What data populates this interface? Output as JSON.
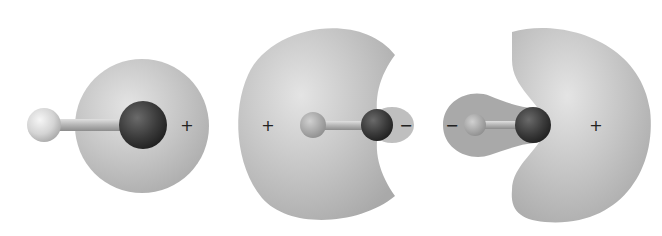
{
  "diagram": {
    "type": "molecular-orbital-lobes",
    "panels": [
      {
        "id": "orbital-1",
        "left_atom": "light-small-atom",
        "right_atom": "dark-large-atom",
        "signs": [
          {
            "label": "+",
            "x": 187,
            "y": 126
          }
        ]
      },
      {
        "id": "orbital-2",
        "left_atom": "light-small-atom",
        "right_atom": "dark-large-atom",
        "signs": [
          {
            "label": "+",
            "x": 268,
            "y": 126
          },
          {
            "label": "−",
            "x": 406,
            "y": 126
          }
        ]
      },
      {
        "id": "orbital-3",
        "left_atom": "light-small-atom",
        "right_atom": "dark-large-atom",
        "signs": [
          {
            "label": "−",
            "x": 452,
            "y": 126
          },
          {
            "label": "+",
            "x": 596,
            "y": 126
          }
        ]
      }
    ],
    "colors": {
      "lobe": "#b9b9b9",
      "lobe_highlight": "#e2e2e2",
      "dark_atom": "#3a3a3a",
      "light_atom": "#d8d8d8",
      "bond": "#a8a8a8"
    }
  },
  "labels": {
    "p1_plus": "+",
    "p2_plus": "+",
    "p2_minus": "−",
    "p3_minus": "−",
    "p3_plus": "+"
  }
}
